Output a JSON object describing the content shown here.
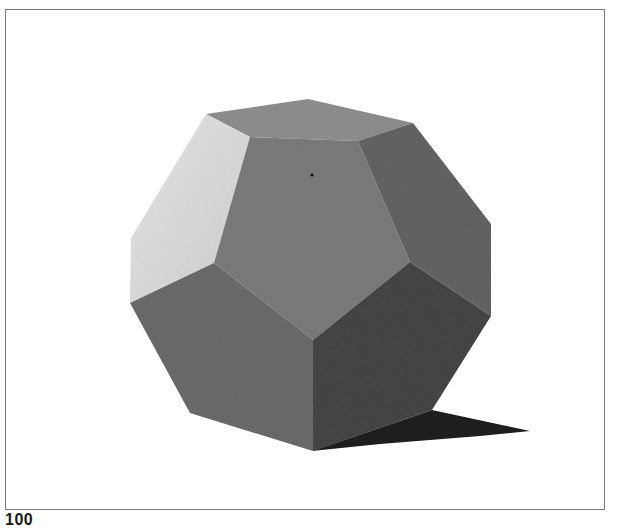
{
  "figure": {
    "colors": {
      "background": "#ffffff",
      "frame_border": "#7a7a7a",
      "face_top": "#8e8e8e",
      "face_left_lit": "#dcdcdc",
      "face_front": "#7b7b7b",
      "face_right_upper": "#646464",
      "face_lower_left": "#6a6a6a",
      "face_lower_right": "#454545",
      "shadow": "#1e1e1e",
      "dot": "#111111"
    }
  },
  "footer": {
    "page_number": "100"
  }
}
